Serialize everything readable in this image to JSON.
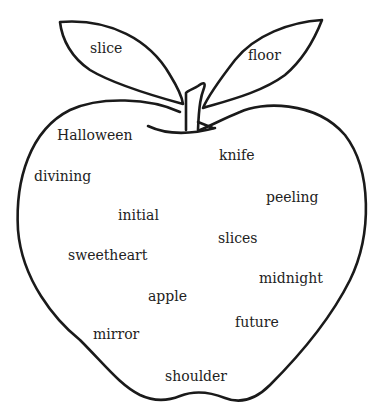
{
  "diagram": {
    "type": "apple-word-cloud",
    "stroke_color": "#1a1a1a",
    "text_color": "#222222",
    "leaves": [
      {
        "id": "left-leaf",
        "word": "slice",
        "x": 90,
        "y": 41
      },
      {
        "id": "right-leaf",
        "word": "floor",
        "x": 248,
        "y": 48
      }
    ],
    "words": [
      {
        "word": "Halloween",
        "x": 57,
        "y": 128
      },
      {
        "word": "knife",
        "x": 219,
        "y": 148
      },
      {
        "word": "divining",
        "x": 34,
        "y": 169
      },
      {
        "word": "peeling",
        "x": 266,
        "y": 190
      },
      {
        "word": "initial",
        "x": 118,
        "y": 208
      },
      {
        "word": "slices",
        "x": 218,
        "y": 231
      },
      {
        "word": "sweetheart",
        "x": 68,
        "y": 248
      },
      {
        "word": "midnight",
        "x": 259,
        "y": 271
      },
      {
        "word": "apple",
        "x": 148,
        "y": 289
      },
      {
        "word": "future",
        "x": 235,
        "y": 315
      },
      {
        "word": "mirror",
        "x": 93,
        "y": 327
      },
      {
        "word": "shoulder",
        "x": 165,
        "y": 369
      }
    ]
  }
}
